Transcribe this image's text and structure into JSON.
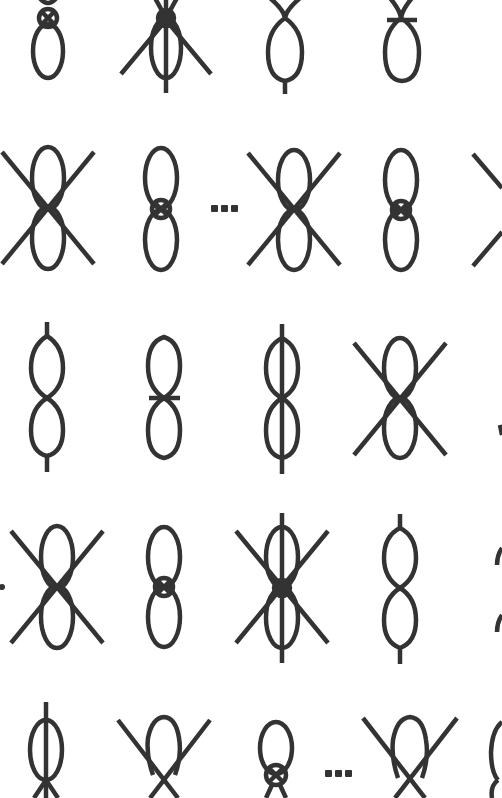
{
  "colors": {
    "stroke": "#333333",
    "background": "#ffffff"
  },
  "stroke_width": 4,
  "rows": [
    {
      "y": 0,
      "items": [
        {
          "type": "loop-crossed-circle-top",
          "cx": 48,
          "cy": 45
        },
        {
          "type": "loop-crossed-lines-dot-top",
          "cx": 166,
          "cy": 45
        },
        {
          "type": "loop-twist-stem-bottom",
          "cx": 285,
          "cy": 45
        },
        {
          "type": "loop-twist-bar-top",
          "cx": 401,
          "cy": 45
        }
      ]
    },
    {
      "y": 208,
      "items": [
        {
          "type": "figure8-x",
          "cx": 48
        },
        {
          "type": "figure8-circle",
          "cx": 161
        },
        {
          "type": "ellipsis",
          "cx": 228
        },
        {
          "type": "figure8-x",
          "cx": 294
        },
        {
          "type": "figure8-circle",
          "cx": 401
        },
        {
          "type": "figure8-x-partial",
          "cx": 500
        }
      ]
    },
    {
      "y": 398,
      "items": [
        {
          "type": "figure8-stems",
          "cx": 47
        },
        {
          "type": "figure8-bar",
          "cx": 164
        },
        {
          "type": "figure8-vertical-line",
          "cx": 282
        },
        {
          "type": "figure8-x",
          "cx": 400
        }
      ]
    },
    {
      "y": 587,
      "items": [
        {
          "type": "figure8-x",
          "cx": 57
        },
        {
          "type": "figure8-circle",
          "cx": 164
        },
        {
          "type": "figure8-x-vertical-dot",
          "cx": 282
        },
        {
          "type": "figure8-stems",
          "cx": 400
        }
      ]
    },
    {
      "y": 760,
      "items": [
        {
          "type": "loop-vertical-line-cross-bottom",
          "cx": 46
        },
        {
          "type": "loop-x-bottom",
          "cx": 163
        },
        {
          "type": "loop-crossed-circle-bottom",
          "cx": 276
        },
        {
          "type": "ellipsis",
          "cx": 343
        },
        {
          "type": "loop-x-bottom",
          "cx": 409
        },
        {
          "type": "loop-partial",
          "cx": 500
        }
      ]
    }
  ],
  "ellipsis_label": "..."
}
